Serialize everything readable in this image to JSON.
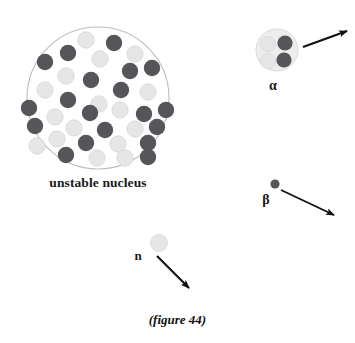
{
  "figure": {
    "caption": "(figure 44)",
    "background_color": "#ffffff",
    "width": 355,
    "height": 343
  },
  "labels": {
    "nucleus": "unstable nucleus",
    "alpha": "α",
    "beta": "β",
    "neutron": "n"
  },
  "colors": {
    "proton": "#55555a",
    "neutron": "#e6e6e6",
    "neutron_stroke": "#d8d8d8",
    "nucleus_outline": "#bdbdbd",
    "alpha_shell": "#ededed",
    "alpha_shell_stroke": "#dcdcdc",
    "arrow": "#111111",
    "text": "#1a1a1a"
  },
  "chart_data": {
    "type": "scatter",
    "title": "(figure 44)",
    "xlabel": "",
    "ylabel": "",
    "nucleus": {
      "label": "unstable nucleus",
      "center": [
        98,
        98
      ],
      "radius": 71,
      "particle_radius": 8.2,
      "proton_count": 18,
      "neutron_count": 17,
      "particles": [
        {
          "type": "neutron",
          "x": 86,
          "y": 40
        },
        {
          "type": "proton",
          "x": 114,
          "y": 43
        },
        {
          "type": "proton",
          "x": 68,
          "y": 53
        },
        {
          "type": "neutron",
          "x": 135,
          "y": 54
        },
        {
          "type": "proton",
          "x": 45,
          "y": 62
        },
        {
          "type": "neutron",
          "x": 100,
          "y": 59
        },
        {
          "type": "proton",
          "x": 130,
          "y": 71
        },
        {
          "type": "proton",
          "x": 152,
          "y": 68
        },
        {
          "type": "neutron",
          "x": 66,
          "y": 76
        },
        {
          "type": "proton",
          "x": 91,
          "y": 80
        },
        {
          "type": "neutron",
          "x": 45,
          "y": 90
        },
        {
          "type": "proton",
          "x": 121,
          "y": 90
        },
        {
          "type": "neutron",
          "x": 148,
          "y": 92
        },
        {
          "type": "proton",
          "x": 68,
          "y": 100
        },
        {
          "type": "neutron",
          "x": 99,
          "y": 104
        },
        {
          "type": "proton",
          "x": 29,
          "y": 108
        },
        {
          "type": "proton",
          "x": 90,
          "y": 113
        },
        {
          "type": "neutron",
          "x": 120,
          "y": 110
        },
        {
          "type": "proton",
          "x": 144,
          "y": 114
        },
        {
          "type": "neutron",
          "x": 55,
          "y": 117
        },
        {
          "type": "proton",
          "x": 166,
          "y": 110
        },
        {
          "type": "proton",
          "x": 35,
          "y": 126
        },
        {
          "type": "neutron",
          "x": 74,
          "y": 128
        },
        {
          "type": "proton",
          "x": 105,
          "y": 130
        },
        {
          "type": "neutron",
          "x": 135,
          "y": 129
        },
        {
          "type": "proton",
          "x": 157,
          "y": 127
        },
        {
          "type": "neutron",
          "x": 57,
          "y": 139
        },
        {
          "type": "proton",
          "x": 86,
          "y": 143
        },
        {
          "type": "neutron",
          "x": 118,
          "y": 144
        },
        {
          "type": "proton",
          "x": 148,
          "y": 143
        },
        {
          "type": "neutron",
          "x": 37,
          "y": 146
        },
        {
          "type": "proton",
          "x": 66,
          "y": 155
        },
        {
          "type": "neutron",
          "x": 97,
          "y": 158
        },
        {
          "type": "neutron",
          "x": 125,
          "y": 158
        },
        {
          "type": "proton",
          "x": 148,
          "y": 157
        }
      ]
    },
    "emissions": [
      {
        "name": "alpha",
        "label": "α",
        "shell": {
          "x": 277,
          "y": 50,
          "r": 21
        },
        "particles": [
          {
            "type": "proton",
            "x": 285,
            "y": 43
          },
          {
            "type": "proton",
            "x": 284,
            "y": 60
          },
          {
            "type": "neutron",
            "x": 268,
            "y": 44
          },
          {
            "type": "neutron",
            "x": 268,
            "y": 61
          }
        ],
        "arrow": {
          "x1": 303,
          "y1": 47,
          "x2": 347,
          "y2": 31
        }
      },
      {
        "name": "beta",
        "label": "β",
        "particles": [
          {
            "type": "proton",
            "x": 275,
            "y": 184,
            "r": 4.6
          }
        ],
        "arrow": {
          "x1": 281,
          "y1": 190,
          "x2": 334,
          "y2": 215
        }
      },
      {
        "name": "neutron",
        "label": "n",
        "particles": [
          {
            "type": "neutron",
            "x": 159,
            "y": 243,
            "r": 8.5
          }
        ],
        "arrow": {
          "x1": 157,
          "y1": 256,
          "x2": 189,
          "y2": 288
        }
      }
    ]
  }
}
